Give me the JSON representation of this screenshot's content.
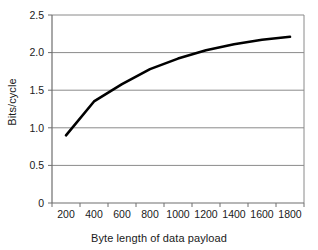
{
  "chart_data": {
    "type": "line",
    "title": "",
    "xlabel": "Byte length of data payload",
    "ylabel": "Bits/cycle",
    "x": [
      200,
      400,
      600,
      800,
      1000,
      1200,
      1400,
      1600,
      1800
    ],
    "values": [
      0.9,
      1.35,
      1.58,
      1.78,
      1.92,
      2.03,
      2.11,
      2.17,
      2.21
    ],
    "series": [
      {
        "name": "Bits/cycle",
        "values": [
          0.9,
          1.35,
          1.58,
          1.78,
          1.92,
          2.03,
          2.11,
          2.17,
          2.21
        ],
        "color": "#000000"
      }
    ],
    "xtick_labels": [
      "200",
      "400",
      "600",
      "800",
      "1000",
      "1200",
      "1400",
      "1600",
      "1800"
    ],
    "ytick_labels": [
      "0",
      "0.5",
      "1.0",
      "1.5",
      "2.0",
      "2.5"
    ],
    "ytick_values": [
      0,
      0.5,
      1.0,
      1.5,
      2.0,
      2.5
    ],
    "ylim": [
      0,
      2.5
    ],
    "xlim": [
      100,
      1900
    ],
    "grid": "horizontal",
    "legend": "none",
    "line_color": "#000000",
    "grid_color": "#808080",
    "axis_color": "#808080",
    "background": "#ffffff"
  },
  "axes": {
    "x_title": "Byte length of data payload",
    "y_title": "Bits/cycle"
  },
  "y_ticks": [
    {
      "label": "2.5"
    },
    {
      "label": "2.0"
    },
    {
      "label": "1.5"
    },
    {
      "label": "1.0"
    },
    {
      "label": "0.5"
    },
    {
      "label": "0"
    }
  ],
  "x_ticks": [
    {
      "label": "200"
    },
    {
      "label": "400"
    },
    {
      "label": "600"
    },
    {
      "label": "800"
    },
    {
      "label": "1000"
    },
    {
      "label": "1200"
    },
    {
      "label": "1400"
    },
    {
      "label": "1600"
    },
    {
      "label": "1800"
    }
  ]
}
